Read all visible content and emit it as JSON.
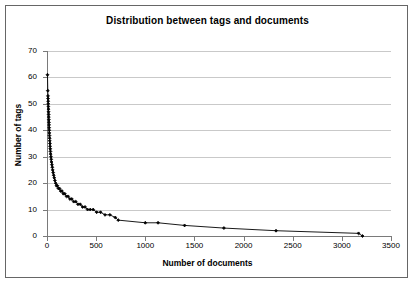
{
  "figure": {
    "title": "Distribution between tags and documents",
    "background": "#ffffff",
    "border_color": "#666666",
    "gridline_color": "#c9c9c9",
    "axis_color": "#7a7a7a",
    "series_color": "#000000"
  },
  "axes": {
    "x_title": "Number of documents",
    "y_title": "Number of tags",
    "x_ticks": [
      "0",
      "500",
      "1000",
      "1500",
      "2000",
      "2500",
      "3000",
      "3500"
    ],
    "y_ticks": [
      "0",
      "10",
      "20",
      "30",
      "40",
      "50",
      "60",
      "70"
    ]
  },
  "chart_data": {
    "type": "line",
    "title": "Distribution between tags and documents",
    "xlabel": "Number of documents",
    "ylabel": "Number of tags",
    "xlim": [
      0,
      3500
    ],
    "ylim": [
      0,
      70
    ],
    "xticks": [
      0,
      500,
      1000,
      1500,
      2000,
      2500,
      3000,
      3500
    ],
    "yticks": [
      0,
      10,
      20,
      30,
      40,
      50,
      60,
      70
    ],
    "grid": "horizontal",
    "legend": "none",
    "markers": "filled-diamond",
    "series": [
      {
        "name": "tags per document count",
        "points": [
          [
            5,
            61
          ],
          [
            8,
            55
          ],
          [
            10,
            53
          ],
          [
            11,
            52
          ],
          [
            12,
            51
          ],
          [
            13,
            50
          ],
          [
            14,
            49
          ],
          [
            15,
            48
          ],
          [
            16,
            47
          ],
          [
            17,
            46
          ],
          [
            18,
            45
          ],
          [
            19,
            44
          ],
          [
            20,
            43
          ],
          [
            21,
            42
          ],
          [
            22,
            41
          ],
          [
            23,
            40
          ],
          [
            24,
            39
          ],
          [
            25,
            38
          ],
          [
            27,
            37
          ],
          [
            28,
            36
          ],
          [
            30,
            35
          ],
          [
            31,
            34
          ],
          [
            33,
            33
          ],
          [
            35,
            32
          ],
          [
            37,
            31
          ],
          [
            40,
            30
          ],
          [
            43,
            29
          ],
          [
            46,
            28
          ],
          [
            50,
            27
          ],
          [
            54,
            26
          ],
          [
            58,
            25
          ],
          [
            63,
            24
          ],
          [
            68,
            23
          ],
          [
            74,
            22
          ],
          [
            80,
            21
          ],
          [
            88,
            20
          ],
          [
            97,
            19
          ],
          [
            106,
            19
          ],
          [
            116,
            18
          ],
          [
            127,
            18
          ],
          [
            139,
            17
          ],
          [
            152,
            17
          ],
          [
            166,
            16
          ],
          [
            181,
            16
          ],
          [
            198,
            15
          ],
          [
            215,
            15
          ],
          [
            233,
            14
          ],
          [
            252,
            14
          ],
          [
            272,
            13
          ],
          [
            293,
            13
          ],
          [
            315,
            12
          ],
          [
            338,
            12
          ],
          [
            362,
            11
          ],
          [
            387,
            11
          ],
          [
            413,
            10
          ],
          [
            440,
            10
          ],
          [
            470,
            10
          ],
          [
            505,
            9
          ],
          [
            545,
            9
          ],
          [
            590,
            8
          ],
          [
            640,
            8
          ],
          [
            695,
            7
          ],
          [
            725,
            6
          ],
          [
            1000,
            5
          ],
          [
            1130,
            5
          ],
          [
            1400,
            4
          ],
          [
            1800,
            3
          ],
          [
            2330,
            2
          ],
          [
            3170,
            1
          ],
          [
            3210,
            0
          ]
        ]
      }
    ]
  }
}
